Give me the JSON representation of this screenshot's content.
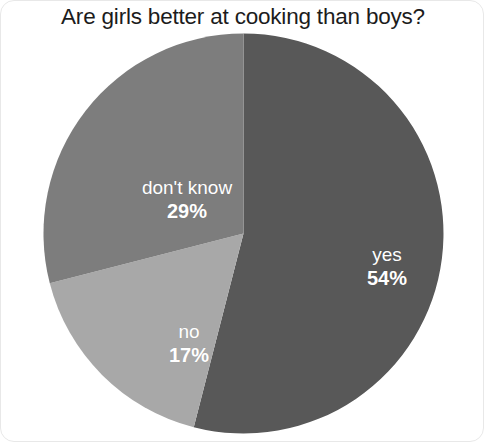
{
  "chart_data": {
    "type": "pie",
    "title": "Are girls better at cooking than boys?",
    "categories": [
      "yes",
      "no",
      "don't know"
    ],
    "values": [
      54,
      17,
      29
    ],
    "unit": "%",
    "labels": [
      "54%",
      "17%",
      "29%"
    ],
    "colors": [
      "#585858",
      "#a8a8a8",
      "#7d7d7d"
    ],
    "legend": "none",
    "grid": false,
    "label_position": "inside",
    "label_color": "#ffffff",
    "start_angle_deg": 0,
    "direction": "clockwise",
    "slices": [
      {
        "name": "yes",
        "value": 54,
        "label": "54%",
        "color": "#585858"
      },
      {
        "name": "no",
        "value": 17,
        "label": "17%",
        "color": "#a8a8a8"
      },
      {
        "name": "don't know",
        "value": 29,
        "label": "29%",
        "color": "#7d7d7d"
      }
    ]
  },
  "figure": {
    "background": "#ffffff",
    "border_color": "#e8e8e8",
    "title_color": "#1c1c1c"
  }
}
